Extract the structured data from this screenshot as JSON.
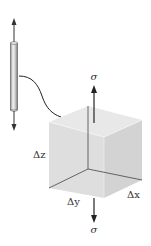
{
  "diagram": {
    "type": "stress-element",
    "colors": {
      "line": "#333333",
      "face_top": "#e6e6e6",
      "face_left": "#dcdcdc",
      "face_right": "#d2d2d2",
      "rod_light": "#f2f2f2",
      "rod_dark": "#9a9a9a"
    },
    "labels": {
      "sigma_top": "σ",
      "sigma_bottom": "σ",
      "delta_z": "Δz",
      "delta_y": "Δy",
      "delta_x": "Δx"
    },
    "elements": [
      {
        "id": "rod",
        "description": "axially loaded bar with tensile arrows at both ends"
      },
      {
        "id": "connector",
        "description": "curved leader line from bar to enlarged element"
      },
      {
        "id": "cube",
        "description": "enlarged volume element with dimensions Δx, Δy, Δz"
      },
      {
        "id": "stress-arrows",
        "description": "normal stress σ acting on top and bottom faces"
      }
    ]
  }
}
